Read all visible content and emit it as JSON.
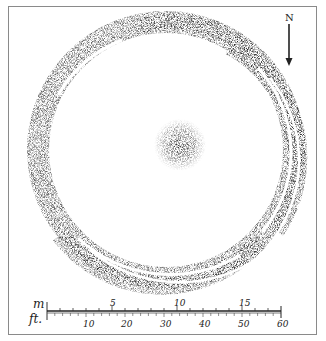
{
  "diagram": {
    "type": "archaeological site plan",
    "features": [
      "outer-bank",
      "inner-ditch-arcs",
      "central-mound"
    ],
    "north_arrow": {
      "label": "N"
    },
    "scale_bar": {
      "meters": {
        "unit_label": "m",
        "ticks": [
          "5",
          "10",
          "15"
        ],
        "max": 18
      },
      "feet": {
        "unit_label": "ft.",
        "ticks": [
          "10",
          "20",
          "30",
          "40",
          "50",
          "60"
        ],
        "max": 60
      }
    },
    "colors": {
      "stipple": "#3a3a3a",
      "frame": "#8a8a8a",
      "background": "#ffffff"
    }
  }
}
